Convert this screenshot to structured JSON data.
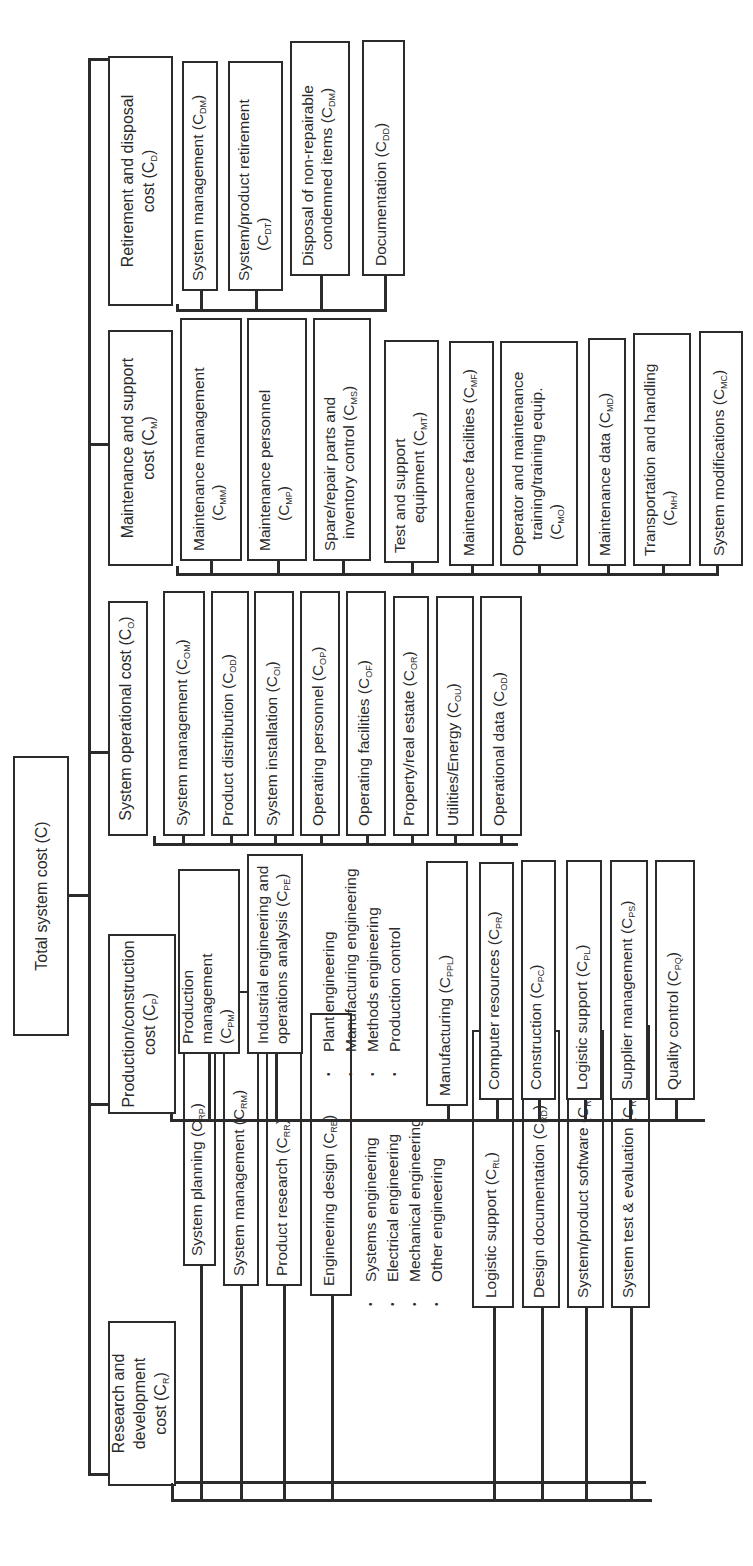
{
  "root": {
    "label": "Total system cost",
    "symbol": "(C)"
  },
  "branches": [
    {
      "id": "research",
      "label_line1": "Research and development",
      "label_line2_prefix": "cost (C",
      "label_sub": "R",
      "items": [
        {
          "label": "System planning (C",
          "sub": "RP",
          "tail": ")"
        },
        {
          "label": "System management (C",
          "sub": "RM",
          "tail": ")"
        },
        {
          "label": "Product research (C",
          "sub": "RR",
          "tail": ")"
        },
        {
          "label": "Engineering design (C",
          "sub": "RE",
          "tail": ")"
        },
        {
          "label": "Logistic support (C",
          "sub": "RL",
          "tail": ")"
        },
        {
          "label": "Design documentation (C",
          "sub": "RD",
          "tail": ")"
        },
        {
          "label": "System/product software (C",
          "sub": "RS",
          "tail": ")"
        },
        {
          "label": "System test & evaluation (C",
          "sub": "RT",
          "tail": ")"
        }
      ],
      "sub_bullets": [
        "Systems engineering",
        "Electrical engineering",
        "Mechanical engineering",
        "Other engineering"
      ]
    },
    {
      "id": "production",
      "label_line1": "Production/construction",
      "label_line2_prefix": "cost (C",
      "label_sub": "P",
      "items": [
        {
          "label": "Production management",
          "line2": "(C",
          "sub": "PM",
          "tail": ")"
        },
        {
          "label": "Industrial engineering and",
          "line2": "operations analysis (C",
          "sub": "PE",
          "tail": ")"
        },
        {
          "label": "Manufacturing (C",
          "sub": "PPL",
          "tail": ")"
        },
        {
          "label": "Computer resources (C",
          "sub": "PR",
          "tail": ")"
        },
        {
          "label": "Construction (C",
          "sub": "PC",
          "tail": ")"
        },
        {
          "label": "Logistic support (C",
          "sub": "PL",
          "tail": ")"
        },
        {
          "label": "Supplier management (C",
          "sub": "PS",
          "tail": ")"
        },
        {
          "label": "Quality control (C",
          "sub": "PQ",
          "tail": ")"
        }
      ],
      "sub_bullets": [
        "Plant engineering",
        "Manufacturing engineering",
        "Methods engineering",
        "Production control"
      ]
    },
    {
      "id": "operational",
      "label_line1": "System operational cost (C",
      "label_sub": "O",
      "items": [
        {
          "label": "System management (C",
          "sub": "OM",
          "tail": ")"
        },
        {
          "label": "Product distribution (C",
          "sub": "OD",
          "tail": ")"
        },
        {
          "label": "System installation (C",
          "sub": "OI",
          "tail": ")"
        },
        {
          "label": "Operating personnel (C",
          "sub": "OP",
          "tail": ")"
        },
        {
          "label": "Operating facilities (C",
          "sub": "OF",
          "tail": ")"
        },
        {
          "label": "Property/real estate (C",
          "sub": "OR",
          "tail": ")"
        },
        {
          "label": "Utilities/Energy (C",
          "sub": "OU",
          "tail": ")"
        },
        {
          "label": "Operational data (C",
          "sub": "OD",
          "tail": ")"
        }
      ]
    },
    {
      "id": "maintenance",
      "label_line1": "Maintenance and support",
      "label_line2_prefix": "cost (C",
      "label_sub": "M",
      "items": [
        {
          "label": "Maintenance management",
          "line2": "(C",
          "sub": "MM",
          "tail": ")"
        },
        {
          "label": "Maintenance personnel",
          "line2": "(C",
          "sub": "MP",
          "tail": ")"
        },
        {
          "label": "Spare/repair parts and",
          "line2": "inventory control (C",
          "sub": "MS",
          "tail": ")"
        },
        {
          "label": "Test and support",
          "line2": "equipment (C",
          "sub": "MT",
          "tail": ")"
        },
        {
          "label": "Maintenance facilities (C",
          "sub": "MF",
          "tail": ")"
        },
        {
          "label": "Operator and maintenance",
          "line2": "training/training equip.",
          "line3": "(C",
          "sub": "MO",
          "tail": ")"
        },
        {
          "label": "Maintenance data (C",
          "sub": "MD",
          "tail": ")"
        },
        {
          "label": "Transportation and handling",
          "line2": "(C",
          "sub": "MH",
          "tail": ")"
        },
        {
          "label": "System modifications (C",
          "sub": "MC",
          "tail": ")"
        }
      ]
    },
    {
      "id": "retirement",
      "label_line1": "Retirement and disposal",
      "label_line2_prefix": "cost (C",
      "label_sub": "D",
      "items": [
        {
          "label": "System management (C",
          "sub": "DM",
          "tail": ")"
        },
        {
          "label": "System/product retirement",
          "line2": "(C",
          "sub": "DT",
          "tail": ")"
        },
        {
          "label": "Disposal of non-repairable",
          "line2": "condemned items (C",
          "sub": "DM",
          "tail": ")"
        },
        {
          "label": "Documentation (C",
          "sub": "DD",
          "tail": ")"
        }
      ]
    }
  ]
}
